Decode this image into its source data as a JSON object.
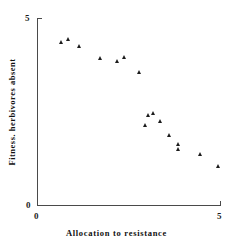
{
  "chart_data": {
    "type": "scatter",
    "title": "",
    "xlabel": "Allocation to resistance",
    "ylabel": "Fitness. herbivores absent",
    "xlim": [
      0,
      5
    ],
    "ylim": [
      0,
      5
    ],
    "xticks": [
      "0",
      "5"
    ],
    "yticks": [
      "0",
      "5"
    ],
    "grid": false,
    "legend": false,
    "marker": "triangle",
    "marker_color": "#1c1c1c",
    "points": [
      {
        "x": 0.66,
        "y": 4.36
      },
      {
        "x": 0.87,
        "y": 4.44
      },
      {
        "x": 1.17,
        "y": 4.25
      },
      {
        "x": 1.75,
        "y": 3.93
      },
      {
        "x": 2.19,
        "y": 3.85
      },
      {
        "x": 2.4,
        "y": 3.96
      },
      {
        "x": 2.79,
        "y": 3.56
      },
      {
        "x": 2.98,
        "y": 2.14
      },
      {
        "x": 3.06,
        "y": 2.39
      },
      {
        "x": 3.19,
        "y": 2.46
      },
      {
        "x": 3.39,
        "y": 2.25
      },
      {
        "x": 3.61,
        "y": 1.87
      },
      {
        "x": 3.88,
        "y": 1.63
      },
      {
        "x": 3.88,
        "y": 1.49
      },
      {
        "x": 4.48,
        "y": 1.36
      },
      {
        "x": 4.97,
        "y": 1.05
      }
    ]
  },
  "axes": {
    "y_top_label": "5",
    "y_bottom_label": "0",
    "x_left_label": "0",
    "x_right_label": "5",
    "x_axis_title": "Allocation to resistance",
    "y_axis_title": "Fitness. herbivores absent"
  }
}
